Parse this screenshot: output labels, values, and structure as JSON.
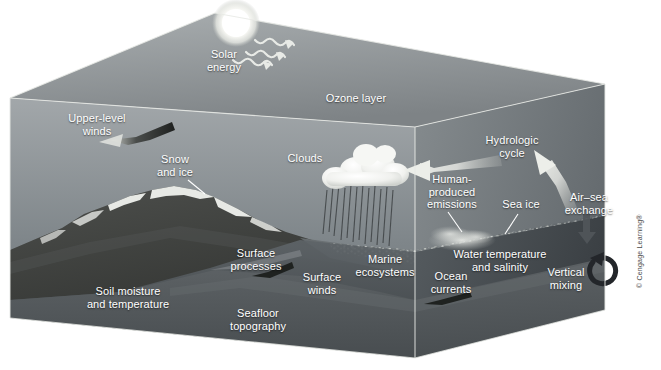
{
  "figure": {
    "type": "earth-climate-system-3d-block-diagram",
    "credit": "© Cengage Learning®",
    "palette": {
      "sky_top": "#9ea3a6",
      "sky_bottom": "#6f767b",
      "top_face": "#8d9295",
      "right_face": "#777c80",
      "ocean": "#5d6367",
      "ocean_deep": "#474c50",
      "seafloor": "#55595c",
      "land_dark": "#3b3d3c",
      "snow": "#f2f3f1",
      "cloud": "#f4f5f3",
      "arrow_light": "#d6d8d6",
      "arrow_dark": "#2d2f2e",
      "sun": "#fdfdfb",
      "label_text": "#ffffff"
    }
  },
  "labels": [
    {
      "id": "solar-energy",
      "text": "Solar\nenergy",
      "x": 224,
      "y": 60
    },
    {
      "id": "ozone-layer",
      "text": "Ozone layer",
      "x": 356,
      "y": 98
    },
    {
      "id": "upper-level-winds",
      "text": "Upper-level\nwinds",
      "x": 97,
      "y": 124
    },
    {
      "id": "snow-and-ice",
      "text": "Snow\nand ice",
      "x": 175,
      "y": 165
    },
    {
      "id": "clouds",
      "text": "Clouds",
      "x": 305,
      "y": 158
    },
    {
      "id": "hydrologic-cycle",
      "text": "Hydrologic\ncycle",
      "x": 512,
      "y": 146
    },
    {
      "id": "human-produced-emissions",
      "text": "Human-\nproduced\nemissions",
      "x": 452,
      "y": 192
    },
    {
      "id": "sea-ice",
      "text": "Sea ice",
      "x": 521,
      "y": 204
    },
    {
      "id": "air-sea-exchange",
      "text": "Air–sea\nexchange",
      "x": 589,
      "y": 203
    },
    {
      "id": "surface-processes",
      "text": "Surface\nprocesses",
      "x": 256,
      "y": 259
    },
    {
      "id": "surface-winds",
      "text": "Surface\nwinds",
      "x": 322,
      "y": 283
    },
    {
      "id": "marine-ecosystems",
      "text": "Marine\necosystems",
      "x": 385,
      "y": 265
    },
    {
      "id": "water-temperature-salinity",
      "text": "Water temperature\nand salinity",
      "x": 500,
      "y": 260
    },
    {
      "id": "ocean-currents",
      "text": "Ocean\ncurrents",
      "x": 451,
      "y": 282
    },
    {
      "id": "vertical-mixing",
      "text": "Vertical\nmixing",
      "x": 566,
      "y": 278
    },
    {
      "id": "soil-moisture-temperature",
      "text": "Soil moisture\nand temperature",
      "x": 128,
      "y": 297
    },
    {
      "id": "seafloor-topography",
      "text": "Seafloor\ntopography",
      "x": 258,
      "y": 319
    }
  ],
  "icons": [
    {
      "id": "sun",
      "name": "sun-icon",
      "cx": 236,
      "cy": 23,
      "r": 17
    },
    {
      "id": "solar-ray-1",
      "name": "solar-ray-wavy-arrow-icon"
    },
    {
      "id": "solar-ray-2",
      "name": "solar-ray-wavy-arrow-icon"
    },
    {
      "id": "solar-ray-3",
      "name": "solar-ray-wavy-arrow-icon"
    },
    {
      "id": "upper-level-wind-arrow",
      "name": "wind-arrow-left-icon"
    },
    {
      "id": "cumulus-cloud",
      "name": "cumulus-cloud-icon"
    },
    {
      "id": "rainfall",
      "name": "rain-streaks-icon"
    },
    {
      "id": "hydrologic-arrow-in",
      "name": "moisture-transport-arrow-left-icon"
    },
    {
      "id": "hydrologic-arrow-up",
      "name": "evaporation-arrow-upleft-icon"
    },
    {
      "id": "smoke-plume",
      "name": "emissions-smoke-plume-icon"
    },
    {
      "id": "air-sea-arrow",
      "name": "air-sea-exchange-arrow-down-icon"
    },
    {
      "id": "vertical-mixing-swirl",
      "name": "circular-mixing-arrow-icon"
    },
    {
      "id": "surface-wind-arrow",
      "name": "surface-wind-arrow-icon"
    },
    {
      "id": "ocean-current-arrow",
      "name": "ocean-current-arrow-icon"
    },
    {
      "id": "surface-process-arrow",
      "name": "surface-process-arrow-icon"
    },
    {
      "id": "snow-ice-pointer",
      "name": "leader-line-icon"
    },
    {
      "id": "emissions-pointer",
      "name": "leader-line-icon"
    },
    {
      "id": "sea-ice-pointer",
      "name": "leader-line-icon"
    }
  ]
}
